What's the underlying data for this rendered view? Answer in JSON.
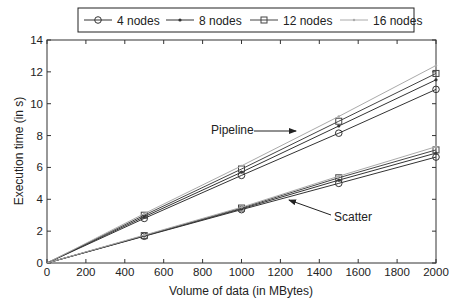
{
  "chart_data": {
    "type": "line",
    "title": "",
    "xlabel": "Volume of data (in MBytes)",
    "ylabel": "Execution time (in s)",
    "xlim": [
      0,
      2000
    ],
    "ylim": [
      0,
      14
    ],
    "xticks": [
      0,
      200,
      400,
      600,
      800,
      1000,
      1200,
      1400,
      1600,
      1800,
      2000
    ],
    "yticks": [
      0,
      2,
      4,
      6,
      8,
      10,
      12,
      14
    ],
    "grid": false,
    "legend_position": "top (outside, above plot)",
    "x": [
      0,
      500,
      1000,
      1500,
      2000
    ],
    "series": [
      {
        "name": "4 nodes",
        "group": "Pipeline",
        "marker": "circle",
        "color": "#333333",
        "values": [
          0,
          2.8,
          5.5,
          8.15,
          10.9
        ]
      },
      {
        "name": "8 nodes",
        "group": "Pipeline",
        "marker": "dot",
        "color": "#333333",
        "values": [
          0,
          2.9,
          5.7,
          8.6,
          11.5
        ]
      },
      {
        "name": "12 nodes",
        "group": "Pipeline",
        "marker": "square",
        "color": "#444444",
        "values": [
          0,
          3.0,
          5.9,
          8.9,
          11.9
        ]
      },
      {
        "name": "16 nodes",
        "group": "Pipeline",
        "marker": "point",
        "color": "#aaaaaa",
        "values": [
          0,
          3.1,
          6.1,
          9.2,
          12.4
        ]
      },
      {
        "name": "4 nodes",
        "group": "Scatter",
        "marker": "circle",
        "color": "#333333",
        "values": [
          0,
          1.68,
          3.35,
          5.0,
          6.65
        ]
      },
      {
        "name": "8 nodes",
        "group": "Scatter",
        "marker": "dot",
        "color": "#333333",
        "values": [
          0,
          1.7,
          3.4,
          5.2,
          6.9
        ]
      },
      {
        "name": "12 nodes",
        "group": "Scatter",
        "marker": "square",
        "color": "#444444",
        "values": [
          0,
          1.72,
          3.45,
          5.35,
          7.1
        ]
      },
      {
        "name": "16 nodes",
        "group": "Scatter",
        "marker": "point",
        "color": "#aaaaaa",
        "values": [
          0,
          1.75,
          3.5,
          5.45,
          7.3
        ]
      }
    ],
    "legend": [
      "4 nodes",
      "8 nodes",
      "12 nodes",
      "16 nodes"
    ],
    "annotations": [
      {
        "text": "Pipeline",
        "x": 900,
        "y": 8.4,
        "arrow_to": [
          1290,
          8.4
        ]
      },
      {
        "text": "Scatter",
        "x": 1480,
        "y": 3.0,
        "arrow_to": [
          1240,
          4.0
        ]
      }
    ]
  }
}
